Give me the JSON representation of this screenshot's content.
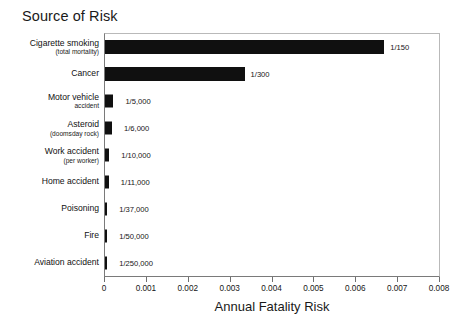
{
  "chart_data": {
    "type": "bar",
    "orientation": "horizontal",
    "title": "Source of Risk",
    "xlabel": "Annual Fatality Risk",
    "ylabel": "",
    "xlim": [
      0,
      0.008
    ],
    "xticks": [
      "0",
      "0.001",
      "0.002",
      "0.003",
      "0.004",
      "0.005",
      "0.006",
      "0.007",
      "0.008"
    ],
    "xtick_values": [
      0,
      0.001,
      0.002,
      0.003,
      0.004,
      0.005,
      0.006,
      0.007,
      0.008
    ],
    "grid": false,
    "legend": "none",
    "categories": [
      "Cigarette smoking (total mortality)",
      "Cancer",
      "Motor vehicle accident",
      "Asteroid (doomsday rock)",
      "Work accident (per worker)",
      "Home accident",
      "Poisoning",
      "Fire",
      "Aviation accident"
    ],
    "values": [
      0.006667,
      0.003333,
      0.0002,
      0.0001667,
      0.0001,
      9.09e-05,
      2.7e-05,
      2e-05,
      4e-06
    ],
    "value_labels": [
      "1/150",
      "1/300",
      "1/5,000",
      "1/6,000",
      "1/10,000",
      "1/11,000",
      "1/37,000",
      "1/50,000",
      "1/250,000"
    ],
    "bars": [
      {
        "label_main": "Cigarette smoking",
        "label_sub": "(total mortality)",
        "value": 0.006667,
        "value_label": "1/150"
      },
      {
        "label_main": "Cancer",
        "label_sub": "",
        "value": 0.003333,
        "value_label": "1/300"
      },
      {
        "label_main": "Motor vehicle",
        "label_sub": "accident",
        "value": 0.0002,
        "value_label": "1/5,000"
      },
      {
        "label_main": "Asteroid",
        "label_sub": "(doomsday rock)",
        "value": 0.0001667,
        "value_label": "1/6,000"
      },
      {
        "label_main": "Work accident",
        "label_sub": "(per worker)",
        "value": 0.0001,
        "value_label": "1/10,000"
      },
      {
        "label_main": "Home accident",
        "label_sub": "",
        "value": 9.09e-05,
        "value_label": "1/11,000"
      },
      {
        "label_main": "Poisoning",
        "label_sub": "",
        "value": 2.7e-05,
        "value_label": "1/37,000"
      },
      {
        "label_main": "Fire",
        "label_sub": "",
        "value": 2e-05,
        "value_label": "1/50,000"
      },
      {
        "label_main": "Aviation accident",
        "label_sub": "",
        "value": 4e-06,
        "value_label": "1/250,000"
      }
    ],
    "colors": {
      "bar": "#101010",
      "background": "#ffffff",
      "axis": "#7a7a7a",
      "text": "#111111"
    }
  }
}
